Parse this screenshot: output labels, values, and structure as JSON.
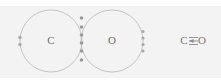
{
  "figure": {
    "background_color": "#f3f3f3",
    "page_color": "#ffffff",
    "line_color": "#bdbdbd",
    "dot_color": "#a9a9a9",
    "text_color": "#6d6d6d"
  },
  "diagram": {
    "type": "electron-dot-overlap",
    "atoms": [
      {
        "id": "carbon",
        "label": "C",
        "cx": 51,
        "cy": 41,
        "r": 31,
        "lone_pairs": [
          {
            "position": "left",
            "dots": 2,
            "x": 20,
            "y": 41
          }
        ]
      },
      {
        "id": "oxygen",
        "label": "O",
        "cx": 112,
        "cy": 41,
        "r": 31,
        "lone_pairs": [
          {
            "position": "right",
            "dots": 4,
            "x": 143,
            "y": 41
          }
        ]
      }
    ],
    "shared_region": {
      "label": "overlap",
      "shared_electron_count": 6,
      "x": 81,
      "dot_ys": [
        18,
        27,
        35,
        43,
        51,
        60
      ]
    }
  },
  "formula": {
    "left_atom": "C",
    "bond_symbol": "≡",
    "right_atom": "O",
    "text": "C≡O",
    "bond_type": "triple-bond-with-dative-arrow",
    "x": 192,
    "y": 41
  }
}
